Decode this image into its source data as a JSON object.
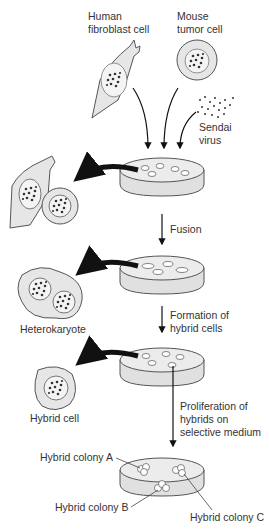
{
  "labels": {
    "human_cell": [
      "Human",
      "fibroblast cell"
    ],
    "mouse_cell": [
      "Mouse",
      "tumor cell"
    ],
    "virus": [
      "Sendai",
      "virus"
    ],
    "fusion": "Fusion",
    "heterokaryote": "Heterokaryote",
    "formation": [
      "Formation of",
      "hybrid cells"
    ],
    "hybrid_cell": "Hybrid cell",
    "proliferation": [
      "Proliferation of",
      "hybrids on",
      "selective medium"
    ],
    "colony_a": "Hybrid colony A",
    "colony_b": "Hybrid colony B",
    "colony_c": "Hybrid colony C"
  },
  "colors": {
    "cell_fill": "#e6e6e6",
    "cell_stroke": "#555555",
    "nucleus_fill": "#f4f4f4",
    "dot": "#333333",
    "arrow": "#111111",
    "dish_fill": "#ececec"
  }
}
